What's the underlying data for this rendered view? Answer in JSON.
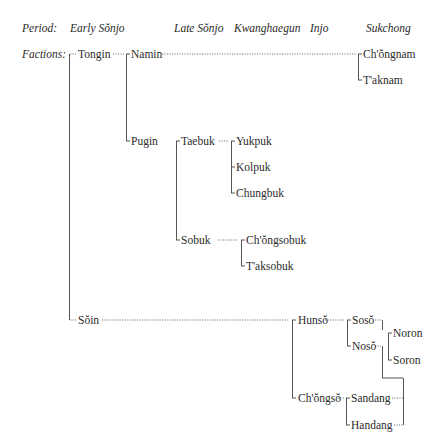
{
  "header": {
    "period_label": "Period:",
    "periods": [
      "Early Sŏnjo",
      "Late Sŏnjo",
      "Kwanghaegun",
      "Injo",
      "Sukchong"
    ]
  },
  "factions_label": "Factions:",
  "tree": {
    "tongin": "Tongin",
    "namin": "Namin",
    "chongnam": "Ch'ŏngnam",
    "taknam": "T'aknam",
    "pugin": "Pugin",
    "taebuk": "Taebuk",
    "yukpuk": "Yukpuk",
    "kolpuk": "Kolpuk",
    "chungbuk": "Chungbuk",
    "sobuk": "Sobuk",
    "chongsobuk": "Ch'ŏngsobuk",
    "taksobuk": "T'aksobuk",
    "soin": "Sŏin",
    "hunso": "Hunsŏ",
    "soso": "Sosŏ",
    "noso": "Nosŏ",
    "noron": "Noron",
    "soron": "Soron",
    "chongso": "Ch'ŏngsŏ",
    "sandang": "Sandang",
    "handang": "Handang"
  }
}
